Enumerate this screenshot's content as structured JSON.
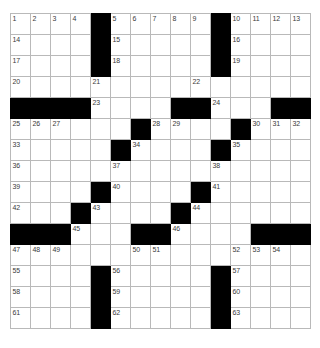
{
  "puzzle": {
    "title": "Crossword Grid",
    "rows": 15,
    "cols": 15,
    "colors": {
      "block": "#000000",
      "cell": "#ffffff",
      "grid_line": "#b9b9b9",
      "border": "#555555",
      "number_text": "#3a3a3a"
    },
    "grid": [
      [
        "1",
        "2",
        "3",
        "4",
        "#",
        "5",
        "6",
        "7",
        "8",
        "9",
        "#",
        "10",
        "11",
        "12",
        "13"
      ],
      [
        "14",
        "",
        "",
        "",
        "#",
        "15",
        "",
        "",
        "",
        "",
        "#",
        "16",
        "",
        "",
        ""
      ],
      [
        "17",
        "",
        "",
        "",
        "#",
        "18",
        "",
        "",
        "",
        "",
        "#",
        "19",
        "",
        "",
        ""
      ],
      [
        "20",
        "",
        "",
        "",
        "21",
        "",
        "",
        "",
        "",
        "22",
        "",
        "",
        "",
        "",
        ""
      ],
      [
        "#",
        "#",
        "#",
        "#",
        "23",
        "",
        "",
        "",
        "#",
        "#",
        "24",
        "",
        "",
        "#",
        "#"
      ],
      [
        "25",
        "26",
        "27",
        "",
        "",
        "",
        "#",
        "28",
        "29",
        "",
        "",
        "#",
        "30",
        "31",
        "32"
      ],
      [
        "33",
        "",
        "",
        "",
        "",
        "#",
        "34",
        "",
        "",
        "",
        "#",
        "35",
        "",
        "",
        ""
      ],
      [
        "36",
        "",
        "",
        "",
        "",
        "37",
        "",
        "",
        "",
        "",
        "38",
        "",
        "",
        "",
        ""
      ],
      [
        "39",
        "",
        "",
        "",
        "#",
        "40",
        "",
        "",
        "",
        "#",
        "41",
        "",
        "",
        "",
        ""
      ],
      [
        "42",
        "",
        "",
        "#",
        "43",
        "",
        "",
        "",
        "#",
        "44",
        "",
        "",
        "",
        "",
        ""
      ],
      [
        "#",
        "#",
        "#",
        "45",
        "",
        "",
        "#",
        "#",
        "46",
        "",
        "",
        "",
        "#",
        "#",
        "#"
      ],
      [
        "47",
        "48",
        "49",
        "",
        "",
        "",
        "50",
        "51",
        "",
        "",
        "",
        "52",
        "53",
        "54",
        ""
      ],
      [
        "55",
        "",
        "",
        "",
        "#",
        "56",
        "",
        "",
        "",
        "",
        "#",
        "57",
        "",
        "",
        ""
      ],
      [
        "58",
        "",
        "",
        "",
        "#",
        "59",
        "",
        "",
        "",
        "",
        "#",
        "60",
        "",
        "",
        ""
      ],
      [
        "61",
        "",
        "",
        "",
        "#",
        "62",
        "",
        "",
        "",
        "",
        "#",
        "63",
        "",
        "",
        ""
      ]
    ]
  }
}
